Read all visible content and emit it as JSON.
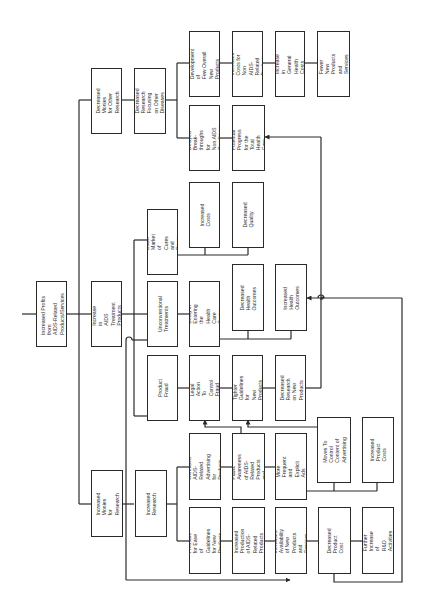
{
  "diagram": {
    "orientation": "rotated 90 degrees counter-clockwise",
    "nodes": {
      "root": "Increased Profits from\nAIDS-Related\nProducts/Services",
      "dec_monies": "Decreased Monies\nfor Other Research",
      "dec_research_other": "Decreased Research\nFocusing on Other\nDiseases",
      "dev_fewer": "Development of\nFew Overall New\nProducts",
      "inc_costs_non_aids": "Increased Costs for\nNon AIDS-Related\nProducts",
      "inc_general_health": "Increase in General\nHealth Costs",
      "fewer_new": "Fewer New Products\nand Services",
      "delayed_break": "Delayed Break-\nthroughs for\nNon AIDS Conditions",
      "poorer_progress": "Poorer Potential\nProgress for the\nTotal Health Care\nPopulation",
      "inc_treatment": "Increase in\nAIDS Treatment\nProducts",
      "black_market": "Black Market\nof Cures and\nDrugs",
      "inc_costs": "Increased\nCosts",
      "dec_quality": "Decreased\nQuality",
      "unconventional": "Unconventional\nTreatments",
      "delay_entering": "Delay in Entering\nthe Health Care\nSystem",
      "dec_health_outcomes": "Decreased\nHealth\nOutcomes",
      "inc_health_outcomes": "Increased\nHealth\nOutcomes",
      "product_fraud": "Product Fraud",
      "legal_action": "Legal Action\nTo Control\nFraud",
      "tighter_guidelines": "Tighter\nGuidelines for\nNew Products",
      "dec_research_new": "Decreased Research\non New Products",
      "inc_monies": "Increased Monies\nfor Research",
      "inc_research": "Increased Research",
      "inc_advertising": "Increased AIDS-Related\nAdvertising for\nProducts",
      "inc_awareness": "Increase in Public\nAwareness of AIDS-\nRelated Products\nand Problems",
      "more_frequent_ads": "More Frequent and\nExplicit Ads",
      "moves_control": "Moves To Control\nContent of\nAdvertising",
      "inc_product_costs": "Increased\nProduct Costs",
      "pressure_guidelines": "Pressure for Ease\nof Guidelines\nfor New Products",
      "inc_production": "Increased Production\nof AIDS-Related\nProducts",
      "inc_availability": "Increased Availability\nof New Products and\nServices",
      "dec_product_cost": "Decreased Product\nCost",
      "further_rd": "Further Increase of\nR&D Activities"
    },
    "colors": {
      "line": "#2a2a2a",
      "background": "#ffffff"
    }
  }
}
